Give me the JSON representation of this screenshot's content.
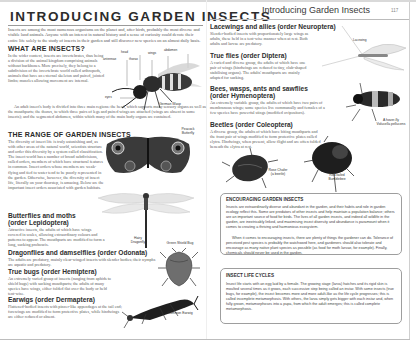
{
  "left_page": {
    "title": "INTRODUCING GARDEN INSECTS",
    "intro": "Insects are among the most numerous organisms on the planet and, after birds, probably the most diverse and visible land animals. Anyone with an interest in natural history and a sense of curiosity could devote their entire life solely to the study of insects in their garden and still discover new species on an almost daily basis.",
    "what_are_insects": {
      "heading": "WHAT ARE INSECTS?",
      "p1": "In the wider context, insects are invertebrates, thus being a division of the animal kingdom comprising animals without backbones. More precisely, they belong to a subdivision of the invertebrate world called arthropods, animals that have an external skeleton and paired, jointed limbs; muscles allowing movement are internal.",
      "p2": "An adult insect's body is divided into three main regions: the head, which supports many sensory organs as well as the mouthparts; the thorax, to which three pairs of legs and paired wings are attached (wings are absent in some insects); and the segmented abdomen, within which many of the main body organs are contained."
    },
    "range": {
      "heading": "THE RANGE OF GARDEN INSECTS",
      "body": "The diversity of insect life is truly astonishing and, as with other areas of the natural world, scientists structure and order this diversity by a system called classification. The insect world has a number of broad subdivisions, called orders, members of which have structural features in common. Insect orders whose members are weak-flying and tied to water tend to be poorly represented in the garden. Otherwise, however, the diversity of insect life, literally on your doorstep, is amazing. Below are the important insect orders associated with garden habitats."
    },
    "orders": [
      {
        "heading": "Butterflies and moths",
        "subheading": "(order Lepidoptera)",
        "body": "Attractive insects, the adults of which have wings covered in scales, allowing extraordinary colours and patterns to appear. The mouthparts are modified to form a long, sucking proboscis."
      },
      {
        "heading": "Dragonflies and damselflies (order Odonata)",
        "body": "The adults are predatory, mainly clear-winged insects with slender bodies; their nymphs are aquatic and predatory."
      },
      {
        "heading": "True bugs (order Hemiptera)",
        "body": "An extremely varied group of insects (ranging from aphids to shield bugs) with sucking mouthparts; the adults of many species have wings, either folded flat over the body or held tent-wise."
      },
      {
        "heading": "Earwigs (order Dermaptera)",
        "body": "Flattened-bodied insects with pincer-like appendages at the tail end; forewings are modified to form protective plates, while hindwings are either reduced or absent."
      }
    ],
    "wasp_labels": {
      "head": "head",
      "thorax": "thorax",
      "wings": "wings",
      "abdomen": "abdomen",
      "antennae": "antennae",
      "eyes": "eyes",
      "caption": "German Wasp"
    },
    "captions": {
      "butterfly": "Peacock Butterfly",
      "dragonfly": "Hairy Dragonfly",
      "shieldbug": "Green Shield Bug",
      "earwig": "Common Earwig"
    }
  },
  "right_page": {
    "header": "Introducing Garden Insects",
    "page_number": "117",
    "orders": [
      {
        "heading": "Lacewings and allies (order Neuroptera)",
        "body": "Slender-bodied insects with proportionately large wings as adults, these held in a tent-wise manner when at rest. Both adults and larvae are predatory."
      },
      {
        "heading": "True flies (order Diptera)",
        "body": "A varied and diverse group, the adults of which have one pair of wings (hindwings are reduced to tiny, club-shaped stabilising organs). The adults' mouthparts are mainly adapted for sucking."
      },
      {
        "heading": "Bees, wasps, ants and sawflies",
        "subheading": "(order Hymenoptera)",
        "body": "An extremely variable group, the adults of which have two pairs of membranous wings; some species live communally and females of a few species have powerful stings (modified ovipositors)."
      },
      {
        "heading": "Beetles (order Coleoptera)",
        "body": "A diverse group, the adults of which have biting mouthparts and the front pair of wings modified to form protective plates called elytra. Hindwings, when present, allow flight and are often folded beneath the elytra at rest."
      }
    ],
    "captions": {
      "lacewing": "Lacewing",
      "hoverfly": "A hover-fly Volucella pellucens",
      "rose_chafer": "Rose Chafer (a beetle)",
      "bumblebee": "Red-tailed Bumblebee"
    },
    "box_encouraging": {
      "title": "ENCOURAGING GARDEN INSECTS",
      "p1": "Insects are extraordinarily diverse and abundant in the garden, and their habits and role in garden ecology reflect this. Some are predators of other insects and help maintain a population balance; others are an important source of food for birds. The lives of all garden insects, and indeed all wildlife in the garden, are inextricably linked, and maximising insect diversity and abundance is paramount when it comes to creating a thriving and harmonious ecosystem.",
      "p2": "When it comes to encouraging insects, there are plenty of things the gardener can do. Tolerance of perceived pest species is probably the watchword here, and gardeners should also tolerate and encourage as many native plant species as possible (as food for moth larvae, for example). Finally, chemicals should never be used in the garden."
    },
    "box_lifecycles": {
      "title": "INSECT LIFE CYCLES",
      "body": "Insect life starts with an egg laid by a female. The growing stage (larva) hatches and its rigid skin is moulted several times as it grows, each successive step being called an instar. With some insects (true bugs, for example), the insect becomes more and more adult-like as the life cycle progresses; this is called incomplete metamorphosis. With others, the larva simply gets bigger with each instar and, when fully grown, metamorphoses into a pupa, from which the adult emerges; this is called complete metamorphosis."
    }
  }
}
